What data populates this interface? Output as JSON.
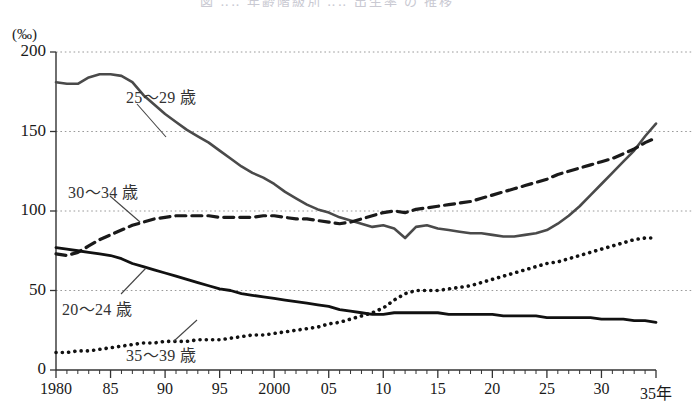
{
  "chart_data": {
    "type": "line",
    "title": "",
    "xlabel": "",
    "ylabel": "",
    "unit_label": "(‰)",
    "x_axis_suffix": "年",
    "xlim": [
      1980,
      2035
    ],
    "ylim": [
      0,
      200
    ],
    "grid": "horizontal-dotted",
    "legend_position": "inline-annotations",
    "y_ticks": [
      "0",
      "50",
      "100",
      "150",
      "200"
    ],
    "y_tick_values": [
      0,
      50,
      100,
      150,
      200
    ],
    "x_ticks": [
      "1980",
      "85",
      "90",
      "95",
      "2000",
      "05",
      "10",
      "15",
      "20",
      "25",
      "30",
      "35年"
    ],
    "x_tick_values": [
      1980,
      1985,
      1990,
      1995,
      2000,
      2005,
      2010,
      2015,
      2020,
      2025,
      2030,
      2035
    ],
    "x_minor_tick_interval": 1,
    "x": [
      1980,
      1981,
      1982,
      1983,
      1984,
      1985,
      1986,
      1987,
      1988,
      1989,
      1990,
      1991,
      1992,
      1993,
      1994,
      1995,
      1996,
      1997,
      1998,
      1999,
      2000,
      2001,
      2002,
      2003,
      2004,
      2005,
      2006,
      2007,
      2008,
      2009,
      2010,
      2011,
      2012,
      2013,
      2014,
      2015,
      2016,
      2017,
      2018,
      2019,
      2020,
      2021,
      2022,
      2023,
      2024,
      2025,
      2026,
      2027,
      2028,
      2029,
      2030,
      2031,
      2032,
      2033,
      2034,
      2035
    ],
    "series": [
      {
        "name": "25〜29歳",
        "label": "25〜29 歳",
        "style": "solid",
        "color": "#4a4a4a",
        "width": 2.6,
        "values": [
          181,
          180,
          180,
          184,
          186,
          186,
          185,
          181,
          173,
          167,
          161,
          156,
          151,
          147,
          143,
          138,
          133,
          128,
          124,
          121,
          117,
          112,
          108,
          104,
          101,
          99,
          96,
          94,
          92,
          90,
          91,
          89,
          83,
          90,
          91,
          89,
          88,
          87,
          86,
          86,
          85,
          84,
          84,
          85,
          86,
          88,
          92,
          97,
          103,
          110,
          117,
          124,
          131,
          138,
          147,
          155
        ]
      },
      {
        "name": "30〜34歳",
        "label": "30〜34 歳",
        "style": "dashed",
        "color": "#1a1a1a",
        "width": 3.2,
        "values": [
          73,
          72,
          74,
          78,
          82,
          85,
          88,
          91,
          93,
          95,
          96,
          97,
          97,
          97,
          97,
          96,
          96,
          96,
          96,
          97,
          97,
          96,
          95,
          95,
          94,
          93,
          92,
          93,
          95,
          97,
          99,
          100,
          99,
          101,
          102,
          103,
          104,
          105,
          106,
          108,
          110,
          112,
          114,
          116,
          118,
          120,
          123,
          125,
          127,
          129,
          131,
          133,
          136,
          139,
          143,
          146
        ]
      },
      {
        "name": "20〜24歳",
        "label": "20〜24 歳",
        "style": "solid",
        "color": "#111111",
        "width": 2.8,
        "values": [
          77,
          76,
          75,
          74,
          73,
          72,
          70,
          67,
          65,
          63,
          61,
          59,
          57,
          55,
          53,
          51,
          50,
          48,
          47,
          46,
          45,
          44,
          43,
          42,
          41,
          40,
          38,
          37,
          36,
          35,
          35,
          36,
          36,
          36,
          36,
          36,
          35,
          35,
          35,
          35,
          35,
          34,
          34,
          34,
          34,
          33,
          33,
          33,
          33,
          33,
          32,
          32,
          32,
          31,
          31,
          30
        ]
      },
      {
        "name": "35〜39歳",
        "label": "35〜39 歳",
        "style": "dotted",
        "color": "#111111",
        "width": 3.6,
        "values": [
          11,
          11,
          12,
          12,
          13,
          14,
          15,
          16,
          17,
          17,
          18,
          18,
          18,
          19,
          19,
          19,
          20,
          21,
          22,
          22,
          23,
          24,
          25,
          26,
          27,
          29,
          30,
          32,
          34,
          36,
          39,
          44,
          48,
          50,
          50,
          50,
          51,
          52,
          53,
          55,
          57,
          59,
          61,
          63,
          65,
          67,
          68,
          70,
          72,
          74,
          76,
          78,
          80,
          82,
          83,
          83
        ]
      }
    ],
    "annotations": [
      {
        "text": "25〜29 歳",
        "x_px": 126,
        "y_px": 84,
        "leader": {
          "x1": 137,
          "y1": 104,
          "x2": 166,
          "y2": 137
        }
      },
      {
        "text": "30〜34 歳",
        "x_px": 68,
        "y_px": 179,
        "leader": {
          "x1": 110,
          "y1": 196,
          "x2": 140,
          "y2": 222
        }
      },
      {
        "text": "20〜24 歳",
        "x_px": 62,
        "y_px": 296,
        "leader": {
          "x1": 121,
          "y1": 294,
          "x2": 146,
          "y2": 268
        }
      },
      {
        "text": "35〜39 歳",
        "x_px": 126,
        "y_px": 342,
        "leader": {
          "x1": 174,
          "y1": 341,
          "x2": 197,
          "y2": 320
        }
      }
    ]
  },
  "top_cutoff_text": "図 ‥‥ 年齢階級別 ‥‥ 出生率 の 推移"
}
